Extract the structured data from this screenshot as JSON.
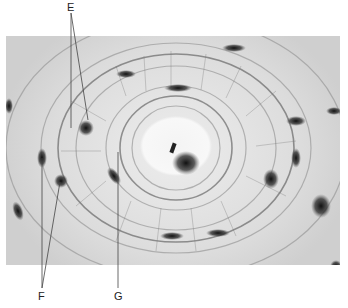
{
  "figure": {
    "type": "micrograph",
    "labels": [
      {
        "id": "E",
        "text": "E",
        "x": 72,
        "y": 7
      },
      {
        "id": "F",
        "text": "F",
        "x": 42,
        "y": 296
      },
      {
        "id": "G",
        "text": "G",
        "x": 119,
        "y": 296
      }
    ]
  }
}
